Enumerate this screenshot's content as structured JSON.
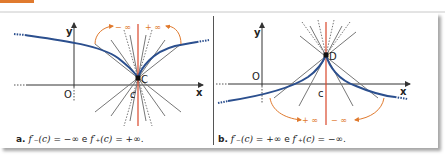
{
  "figure": {
    "colors": {
      "accent": "#e07a2e",
      "curve": "#2b4f8e",
      "axis": "#333333",
      "tangent": "#777777",
      "vertical": "#d9472b"
    },
    "panel_a": {
      "axis_x": "x",
      "axis_y": "y",
      "origin": "O",
      "point": "C",
      "tick": "c",
      "left_limit": "− ∞",
      "right_limit": "+ ∞",
      "caption_letter": "a.",
      "caption_f1": "f′₋(c)",
      "caption_mid1": " = −∞ ",
      "caption_e": "e",
      "caption_f2": " f′₊(c)",
      "caption_mid2": " = +∞."
    },
    "panel_b": {
      "axis_x": "x",
      "axis_y": "y",
      "origin": "O",
      "point": "D",
      "tick": "c",
      "left_limit": "+ ∞",
      "right_limit": "− ∞",
      "caption_letter": "b.",
      "caption_f1": "f′₋(c)",
      "caption_mid1": " = +∞ ",
      "caption_e": "e",
      "caption_f2": " f′₊(c)",
      "caption_mid2": " = −∞."
    }
  }
}
